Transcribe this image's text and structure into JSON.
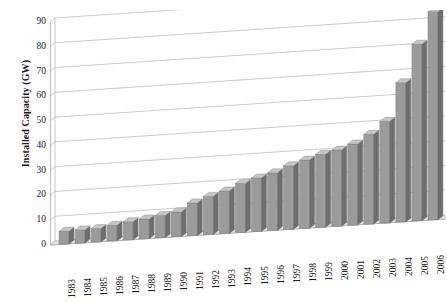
{
  "chart_data": {
    "type": "bar",
    "title": "",
    "subtitle": "",
    "xlabel": "",
    "ylabel": "Installed Capacity (GW)",
    "ylim": [
      0,
      90
    ],
    "ytick_step": 10,
    "yticks": [
      90,
      80,
      70,
      60,
      50,
      40,
      30,
      20,
      10,
      0
    ],
    "grid": true,
    "legend": null,
    "style_3d": true,
    "bar_color": "#9b9b9b",
    "bar_side_color": "#6e6e6e",
    "bar_top_color": "#c6c6c6",
    "axis_color": "#7a7a7a",
    "grid_color": "#b4b4b4",
    "text_color": "#1a1a1a",
    "categories": [
      "1983",
      "1984",
      "1985",
      "1986",
      "1987",
      "1988",
      "1989",
      "1990",
      "1991",
      "1992",
      "1993",
      "1994",
      "1995",
      "1996",
      "1997",
      "1998",
      "1999",
      "2000",
      "2001",
      "2002",
      "2003",
      "2004",
      "2005",
      "2006"
    ],
    "values": [
      5.2,
      5.3,
      5.4,
      6.3,
      7.3,
      8.0,
      9.0,
      10.0,
      13.2,
      15.4,
      17.2,
      19.8,
      21.6,
      23.2,
      25.6,
      27.5,
      29.4,
      30.7,
      32.7,
      36.2,
      41.0,
      56.2,
      71.3,
      84.0
    ]
  }
}
